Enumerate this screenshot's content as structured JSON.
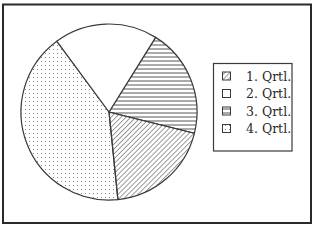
{
  "chart_data": {
    "type": "pie",
    "title": "",
    "categories": [
      "1. Qrtl.",
      "2. Qrtl.",
      "3. Qrtl.",
      "4. Qrtl."
    ],
    "values": [
      19.5,
      19,
      20,
      41.5
    ],
    "patterns": [
      "diagonal-hatch",
      "blank",
      "horizontal-stripes",
      "dots"
    ],
    "start_angle_deg": 32,
    "slice_order_clockwise": [
      "3. Qrtl.",
      "1. Qrtl.",
      "4. Qrtl.",
      "2. Qrtl."
    ],
    "legend_position": "right",
    "grid": false
  },
  "legend": {
    "items": [
      {
        "label": "1. Qrtl.",
        "pattern": "diagonal-hatch"
      },
      {
        "label": "2. Qrtl.",
        "pattern": "blank"
      },
      {
        "label": "3. Qrtl.",
        "pattern": "horizontal-stripes"
      },
      {
        "label": "4. Qrtl.",
        "pattern": "dots"
      }
    ]
  },
  "colors": {
    "stroke": "#3a3a3a",
    "frame": "#2a2a2a",
    "background": "#ffffff",
    "pattern_ink": "#555555"
  }
}
